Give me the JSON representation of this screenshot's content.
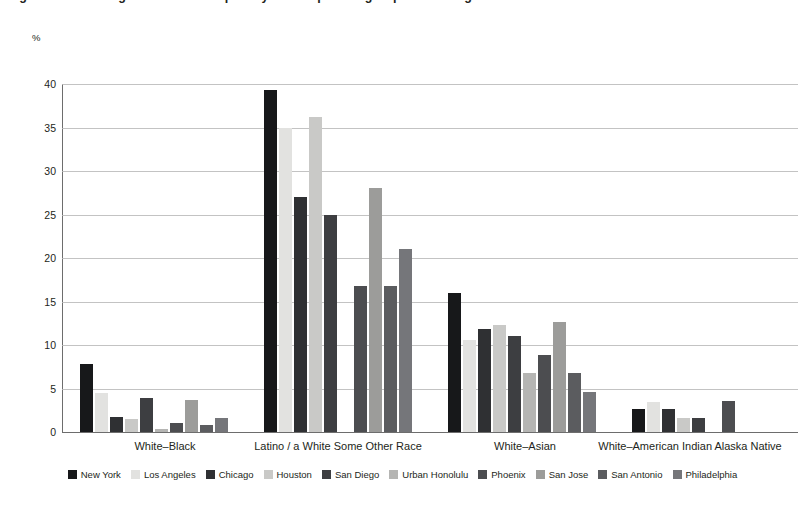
{
  "chart_data": {
    "type": "bar",
    "title": "Figure 1. Percentage of married couples by race of partner groups in the largest U.S. cities",
    "subtitle": "",
    "xlabel": "",
    "ylabel": "%",
    "ylim": [
      0,
      40
    ],
    "yticks": [
      0,
      5,
      10,
      15,
      20,
      25,
      30,
      35,
      40
    ],
    "ytick_labels": [
      "0",
      "5",
      "10",
      "15",
      "20",
      "25",
      "30",
      "35",
      "40"
    ],
    "grid": true,
    "legend_position": "bottom",
    "categories": [
      "White–Black",
      "Latino / a White Some Other Race",
      "White–Asian",
      "White–American Indian Alaska Native"
    ],
    "series": [
      {
        "name": "New York",
        "color": "#17181a",
        "values": [
          7.8,
          39.3,
          16.0,
          2.7
        ]
      },
      {
        "name": "Los Angeles",
        "color": "#e2e2e0",
        "values": [
          4.5,
          35.0,
          10.6,
          3.5
        ]
      },
      {
        "name": "Chicago",
        "color": "#2f3033",
        "values": [
          1.7,
          27.0,
          11.8,
          2.6
        ]
      },
      {
        "name": "Houston",
        "color": "#c9c9c7",
        "values": [
          1.5,
          36.2,
          12.3,
          1.6
        ]
      },
      {
        "name": "San Diego",
        "color": "#3d3e41",
        "values": [
          3.9,
          25.0,
          11.0,
          1.6
        ]
      },
      {
        "name": "Urban Honolulu",
        "color": "#b5b5b3",
        "values": [
          0.4,
          0.0,
          6.8,
          0.0
        ]
      },
      {
        "name": "Phoenix",
        "color": "#4c4d50",
        "values": [
          1.0,
          16.8,
          8.8,
          3.6
        ]
      },
      {
        "name": "San Jose",
        "color": "#9c9c9a",
        "values": [
          3.7,
          28.1,
          12.6,
          0.0
        ]
      },
      {
        "name": "San Antonio",
        "color": "#5b5c5f",
        "values": [
          0.8,
          16.8,
          6.8,
          0.0
        ]
      },
      {
        "name": "Philadelphia",
        "color": "#75767a",
        "values": [
          1.6,
          21.0,
          4.6,
          0.0
        ]
      }
    ]
  },
  "geometry": {
    "plot_left": 62,
    "plot_top": 84,
    "plot_width": 736,
    "plot_height": 348,
    "group_count": 4,
    "bar_width": 13,
    "bar_gap": 2,
    "group_label_centers": [
      165,
      338,
      525,
      690
    ]
  }
}
